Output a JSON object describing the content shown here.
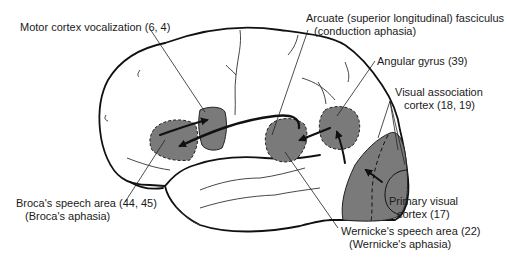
{
  "diagram": {
    "colors": {
      "outline": "#111111",
      "region_fill": "#7a7a7a",
      "background": "#ffffff",
      "text": "#1a1a1a"
    },
    "labels": {
      "motor": {
        "line1": "Motor cortex vocalization (6, 4)"
      },
      "arcuate": {
        "line1": "Arcuate (superior longitudinal) fasciculus",
        "line2": "(conduction aphasia)"
      },
      "angular": {
        "line1": "Angular gyrus (39)"
      },
      "visual_assoc": {
        "line1": "Visual association",
        "line2": "cortex (18, 19)"
      },
      "broca": {
        "line1": "Broca's speech area (44, 45)",
        "line2": "(Broca's aphasia)"
      },
      "primary_visual": {
        "line1": "Primary visual",
        "line2": "cortex (17)"
      },
      "wernicke": {
        "line1": "Wernicke's speech area (22)",
        "line2": "(Wernicke's aphasia)"
      }
    },
    "regions": [
      "broca-area",
      "motor-cortex-vocalization",
      "wernicke-area",
      "angular-gyrus",
      "visual-association-cortex",
      "primary-visual-cortex"
    ],
    "pathway": [
      "primary visual cortex → visual association cortex",
      "visual association cortex → angular gyrus",
      "angular gyrus → Wernicke's area",
      "Wernicke's area → Broca's area (arcuate fasciculus)",
      "Broca's area → motor cortex vocalization"
    ]
  }
}
